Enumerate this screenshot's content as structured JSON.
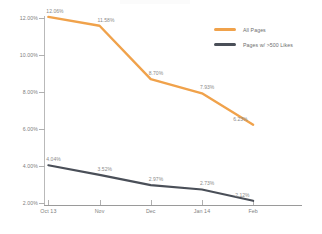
{
  "chart_data": {
    "type": "line",
    "title": "",
    "subtitle": "",
    "xlabel": "",
    "ylabel": "",
    "categories": [
      "Oct 13",
      "Nov",
      "Dec",
      "Jan 14",
      "Feb"
    ],
    "ylim": [
      2.0,
      12.0
    ],
    "ytick_labels": [
      "12.00%",
      "10.00%",
      "8.00%",
      "6.00%",
      "4.00%",
      "2.00%"
    ],
    "ytick_values": [
      12.0,
      10.0,
      8.0,
      6.0,
      4.0,
      2.0
    ],
    "grid": false,
    "legend_position": "top-right",
    "series": [
      {
        "name": "All Pages",
        "color": "#F0A24B",
        "values": [
          12.06,
          11.58,
          8.7,
          7.93,
          6.23
        ],
        "labels": [
          "12.06%",
          "11.58%",
          "8.70%",
          "7.93%",
          "6.23%"
        ]
      },
      {
        "name": "Pages w/ >500 Likes",
        "color": "#4A4F58",
        "values": [
          4.04,
          3.52,
          2.97,
          2.73,
          2.12
        ],
        "labels": [
          "4.04%",
          "3.52%",
          "2.97%",
          "2.73%",
          "2.12%"
        ]
      }
    ]
  },
  "legend": {
    "items": [
      {
        "label": "All Pages",
        "color": "#F0A24B"
      },
      {
        "label": "Pages w/ >500 Likes",
        "color": "#4A4F58"
      }
    ]
  },
  "axes": {
    "y_labels": [
      "12.00%",
      "10.00%",
      "8.00%",
      "6.00%",
      "4.00%",
      "2.00%"
    ],
    "x_labels": [
      "Oct 13",
      "Nov",
      "Dec",
      "Jan 14",
      "Feb"
    ]
  }
}
